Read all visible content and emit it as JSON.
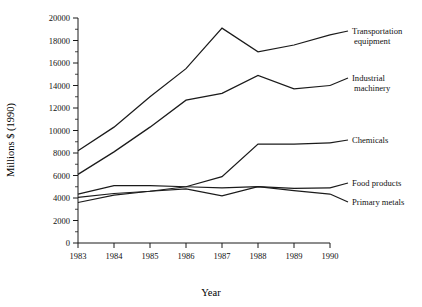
{
  "chart_data": {
    "type": "line",
    "title": "",
    "xlabel": "Year",
    "ylabel": "Millions $ (1990)",
    "x": [
      1983,
      1984,
      1985,
      1986,
      1987,
      1988,
      1989,
      1990
    ],
    "categories": [
      "1983",
      "1984",
      "1985",
      "1986",
      "1987",
      "1988",
      "1989",
      "1990"
    ],
    "xlim": [
      1983,
      1990
    ],
    "ylim": [
      0,
      20000
    ],
    "ytick_labels": [
      "0",
      "2000",
      "4000",
      "6000",
      "8000",
      "10000",
      "12000",
      "14000",
      "16000",
      "18000",
      "20000"
    ],
    "ytick_values": [
      0,
      2000,
      4000,
      6000,
      8000,
      10000,
      12000,
      14000,
      16000,
      18000,
      20000
    ],
    "ytick_minor_step": 1000,
    "grid": false,
    "legend_position": "right-inline-labels",
    "series": [
      {
        "name": "Transportation equipment",
        "label": "Transportation equipment",
        "label_line1": "Transportation",
        "label_line2": "equipment",
        "color": "#1b1b1b",
        "values": [
          8200,
          10300,
          13000,
          15500,
          19100,
          17000,
          17600,
          18500
        ]
      },
      {
        "name": "Industrial machinery",
        "label": "Industrial machinery",
        "label_line1": "Industrial",
        "label_line2": "machinery",
        "color": "#1b1b1b",
        "values": [
          6100,
          8100,
          10300,
          12700,
          13300,
          14900,
          13700,
          14000
        ]
      },
      {
        "name": "Chemicals",
        "label": "Chemicals",
        "label_line1": "Chemicals",
        "label_line2": "",
        "color": "#1b1b1b",
        "values": [
          4050,
          4400,
          4600,
          5000,
          5900,
          8800,
          8800,
          8900
        ]
      },
      {
        "name": "Food products",
        "label": "Food products",
        "label_line1": "Food products",
        "label_line2": "",
        "color": "#1b1b1b",
        "values": [
          4350,
          5100,
          5100,
          5000,
          4900,
          5000,
          4850,
          4900
        ]
      },
      {
        "name": "Primary metals",
        "label": "Primary metals",
        "label_line1": "Primary metals",
        "label_line2": "",
        "color": "#1b1b1b",
        "values": [
          3600,
          4250,
          4600,
          4800,
          4200,
          5000,
          4650,
          4350
        ]
      }
    ]
  },
  "figure": {
    "background": "#ffffff",
    "axis_color": "#1a1a1a",
    "line_color": "#1b1b1b"
  }
}
